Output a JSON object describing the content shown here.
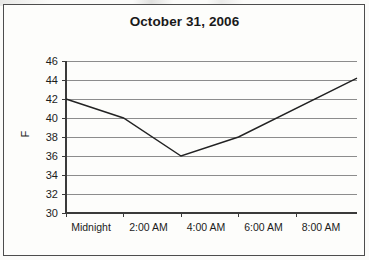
{
  "figure": {
    "title": "October 31, 2006",
    "background_color": "#fdfdfb",
    "frame_color": "#4d4d4d",
    "gridline_color": "#8c8c8c",
    "line_color": "#222222"
  },
  "chart_data": {
    "type": "line",
    "title": "October 31, 2006",
    "xlabel": "",
    "ylabel": "F",
    "x": [
      "Midnight",
      "2:00 AM",
      "4:00 AM",
      "6:00 AM",
      "8:00 AM"
    ],
    "categories": [
      "Midnight",
      "2:00 AM",
      "4:00 AM",
      "6:00 AM",
      "8:00 AM"
    ],
    "values": [
      42,
      40,
      36,
      38,
      44.2
    ],
    "series": [
      {
        "name": "Temperature",
        "values": [
          42,
          40,
          36,
          38,
          44.2
        ]
      }
    ],
    "ylim": [
      30,
      46
    ],
    "yticks": [
      30,
      32,
      34,
      36,
      38,
      40,
      42,
      44,
      46
    ],
    "ytick_labels": [
      "30",
      "32",
      "34",
      "36",
      "38",
      "40",
      "42",
      "44",
      "46"
    ],
    "xtick_labels": [
      "Midnight",
      "2:00 AM",
      "4:00 AM",
      "6:00 AM",
      "8:00 AM"
    ],
    "grid": true,
    "grid_axis": "y",
    "legend": false,
    "legend_position": "none",
    "annotations": []
  }
}
